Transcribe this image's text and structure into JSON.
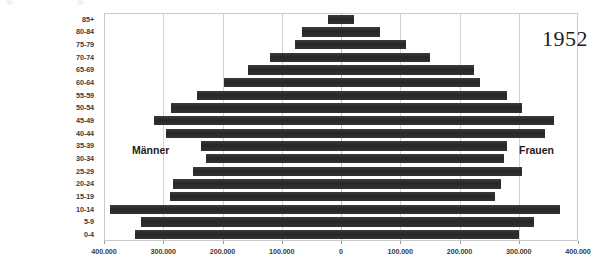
{
  "chart_data": {
    "type": "bar",
    "subtype": "population-pyramid",
    "title": "",
    "year_annotation": "1952",
    "xlabel": "",
    "ylabel": "",
    "grid": true,
    "legend_position": "inside-plot",
    "axis": {
      "unit_note": "",
      "tick_values": [
        -400000,
        -300000,
        -200000,
        -100000,
        0,
        100000,
        200000,
        300000,
        400000
      ],
      "tick_labels": [
        "400.000",
        "300.000",
        "200.000",
        "100.000",
        "0",
        "100.000",
        "200.000",
        "300.000",
        "400.000"
      ],
      "xlim": [
        -400000,
        400000
      ],
      "major_step": 100000
    },
    "categories": [
      "0-4",
      "5-9",
      "10-14",
      "15-19",
      "20-24",
      "25-29",
      "30-34",
      "35-39",
      "40-44",
      "45-49",
      "50-54",
      "55-59",
      "60-64",
      "65-69",
      "70-74",
      "75-79",
      "80-84",
      "85+"
    ],
    "series": [
      {
        "name": "Männer",
        "side": "left",
        "values": [
          348000,
          338000,
          390000,
          288000,
          283000,
          250000,
          228000,
          237000,
          295000,
          315000,
          287000,
          243000,
          197000,
          157000,
          120000,
          78000,
          65000,
          22000
        ]
      },
      {
        "name": "Frauen",
        "side": "right",
        "values": [
          300000,
          325000,
          370000,
          260000,
          270000,
          305000,
          275000,
          280000,
          345000,
          360000,
          305000,
          280000,
          235000,
          225000,
          150000,
          110000,
          65000,
          22000
        ]
      }
    ],
    "colors": {
      "bar": "#2f2f2f",
      "gridline": "#d2d2d2",
      "plot_border": "#c9c9c9",
      "text": "#3a3a3a",
      "annotation_text": "#1d1d1d",
      "background": "#ffffff"
    },
    "annotations": [
      {
        "name": "left-series-label",
        "text": "Männer"
      },
      {
        "name": "right-series-label",
        "text": "Frauen"
      },
      {
        "name": "year-label",
        "text": "1952"
      }
    ]
  }
}
